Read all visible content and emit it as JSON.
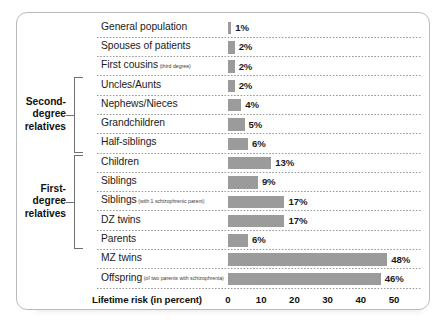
{
  "chart_data": {
    "type": "bar",
    "orientation": "horizontal",
    "title": "",
    "xlabel": "Lifetime risk (in percent)",
    "ylabel": "",
    "xlim": [
      0,
      50
    ],
    "xticks": [
      0,
      10,
      20,
      30,
      40,
      50
    ],
    "grid": false,
    "legend": "none",
    "value_suffix": "%",
    "categories": [
      "General population",
      "Spouses of patients",
      "First cousins",
      "Uncles/Aunts",
      "Nephews/Nieces",
      "Grandchildren",
      "Half-siblings",
      "Children",
      "Siblings",
      "Siblings",
      "DZ twins",
      "Parents",
      "MZ twins",
      "Offspring"
    ],
    "values": [
      1,
      2,
      2,
      2,
      4,
      5,
      6,
      13,
      9,
      17,
      17,
      6,
      48,
      46
    ]
  },
  "rows": [
    {
      "label": "General population",
      "sub": "",
      "value": 1,
      "value_label": "1%"
    },
    {
      "label": "Spouses of patients",
      "sub": "",
      "value": 2,
      "value_label": "2%"
    },
    {
      "label": "First cousins",
      "sub": "(third degree)",
      "value": 2,
      "value_label": "2%"
    },
    {
      "label": "Uncles/Aunts",
      "sub": "",
      "value": 2,
      "value_label": "2%"
    },
    {
      "label": "Nephews/Nieces",
      "sub": "",
      "value": 4,
      "value_label": "4%"
    },
    {
      "label": "Grandchildren",
      "sub": "",
      "value": 5,
      "value_label": "5%"
    },
    {
      "label": "Half-siblings",
      "sub": "",
      "value": 6,
      "value_label": "6%"
    },
    {
      "label": "Children",
      "sub": "",
      "value": 13,
      "value_label": "13%"
    },
    {
      "label": "Siblings",
      "sub": "",
      "value": 9,
      "value_label": "9%"
    },
    {
      "label": "Siblings",
      "sub": "(with 1 schizophrenic parent)",
      "value": 17,
      "value_label": "17%"
    },
    {
      "label": "DZ twins",
      "sub": "",
      "value": 17,
      "value_label": "17%"
    },
    {
      "label": "Parents",
      "sub": "",
      "value": 6,
      "value_label": "6%"
    },
    {
      "label": "MZ twins",
      "sub": "",
      "value": 48,
      "value_label": "48%"
    },
    {
      "label": "Offspring",
      "sub": "(of two parents with  schizophrenia)",
      "value": 46,
      "value_label": "46%"
    }
  ],
  "groups": [
    {
      "label_lines": [
        "Second-",
        "degree",
        "relatives"
      ],
      "start_row": 3,
      "end_row": 6
    },
    {
      "label_lines": [
        "First-",
        "degree",
        "relatives"
      ],
      "start_row": 7,
      "end_row": 11
    }
  ],
  "axis": {
    "title": "Lifetime risk (in percent)",
    "ticks": [
      "0",
      "10",
      "20",
      "30",
      "40",
      "50"
    ]
  },
  "colors": {
    "bar": "#9b9b9b",
    "border": "#b9bcbe",
    "text": "#1b1b1b",
    "bracket": "#6e7174",
    "background": "#ffffff"
  }
}
